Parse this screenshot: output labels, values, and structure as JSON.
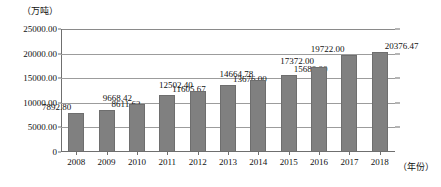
{
  "chart_data": {
    "type": "bar",
    "title": "",
    "subtitle": "",
    "xlabel": "（年份）",
    "ylabel": "（万吨）",
    "ylim": [
      0,
      25000
    ],
    "grid": true,
    "legend": "none",
    "categories": [
      "2008",
      "2009",
      "2010",
      "2011",
      "2012",
      "2013",
      "2014",
      "2015",
      "2016",
      "2017",
      "2018"
    ],
    "values": [
      7892.8,
      8611.62,
      9668.42,
      11605.67,
      12502.4,
      13676.0,
      14664.78,
      15680.0,
      17372.0,
      19722.0,
      20376.47
    ],
    "data_labels": [
      "7892.80",
      "8611.62",
      "9668.42",
      "11605.67",
      "12502.40",
      "13676.00",
      "14664.78",
      "15680.00",
      "17372.00",
      "19722.00",
      "20376.47"
    ],
    "data_label_side": [
      "left",
      "right",
      "left",
      "right",
      "left",
      "right",
      "left",
      "right",
      "left",
      "left",
      "right"
    ],
    "ytick_values": [
      0,
      5000,
      10000,
      15000,
      20000,
      25000
    ],
    "ytick_labels": [
      "0",
      "5000.00",
      "10000.00",
      "15000.00",
      "20000.00",
      "25000.00"
    ],
    "series_color": "#808080",
    "grid_color": "#9c9c9c",
    "axis_color": "#6f6f6f"
  }
}
